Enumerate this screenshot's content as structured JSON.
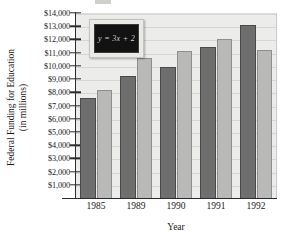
{
  "chart_data": {
    "type": "bar",
    "title": "",
    "xlabel": "Year",
    "ylabel": "Federal Funding for Education (in millions)",
    "ylabel_line1": "Federal Funding for Education",
    "ylabel_line2": "(in millions)",
    "categories": [
      "1985",
      "1989",
      "1990",
      "1991",
      "1992"
    ],
    "series": [
      {
        "name": "dark",
        "color": "#6e6e6e",
        "values": [
          7600,
          9200,
          9950,
          11400,
          13100
        ]
      },
      {
        "name": "light",
        "color": "#b9b9b7",
        "values": [
          8200,
          10600,
          11150,
          12000,
          11200
        ]
      }
    ],
    "ylim": [
      0,
      14000
    ],
    "ytick_values": [
      1000,
      2000,
      3000,
      4000,
      5000,
      6000,
      7000,
      8000,
      9000,
      10000,
      11000,
      12000,
      13000,
      14000
    ],
    "ytick_labels": [
      "$1,000",
      "$2,000",
      "$3,000",
      "$4,000",
      "$5,000",
      "$6,000",
      "$7,000",
      "$8,000",
      "$9,000",
      "$10,000",
      "$11,000",
      "$12,000",
      "$13,000",
      "$14,000"
    ],
    "grid": true,
    "legend": "none",
    "annotations": [
      {
        "name": "chalkboard",
        "text": "y = 3x + 2"
      }
    ]
  },
  "annotation": {
    "equation": "y = 3x + 2"
  },
  "axes": {
    "x_title": "Year",
    "y_title_line1": "Federal Funding for Education",
    "y_title_line2": "(in millions)"
  },
  "colors": {
    "plot_background": "#ececea",
    "gridline": "#d6d6d2",
    "axis": "#2b2b2b",
    "bar_dark": "#6e6e6e",
    "bar_light": "#b9b9b7",
    "chalkboard_frame": "#e9e9e6",
    "chalkboard_surface": "#121212",
    "chalk_text": "#cfcfcf"
  }
}
